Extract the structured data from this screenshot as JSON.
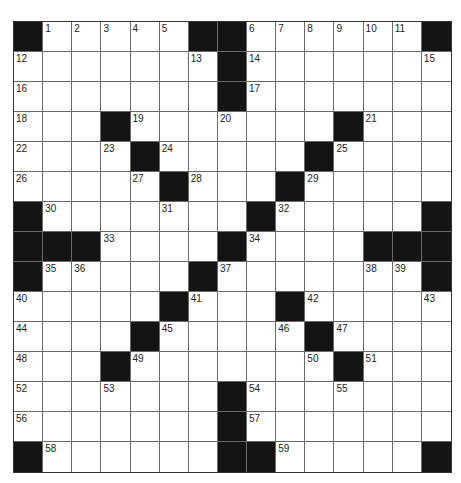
{
  "puzzle": {
    "size": 15,
    "colors": {
      "black_cell": "#141414",
      "white_cell": "#ffffff",
      "grid_line": "#6a6a6a"
    },
    "legend": "rows: '#' = black square, '.' = white square, number = numbered white square",
    "rows": [
      [
        "#",
        "1",
        "2",
        "3",
        "4",
        "5",
        "#",
        "#",
        "6",
        "7",
        "8",
        "9",
        "10",
        "11",
        "#"
      ],
      [
        "12",
        ".",
        ".",
        ".",
        ".",
        ".",
        "13",
        "#",
        "14",
        ".",
        ".",
        ".",
        ".",
        ".",
        "15"
      ],
      [
        "16",
        ".",
        ".",
        ".",
        ".",
        ".",
        ".",
        "#",
        "17",
        ".",
        ".",
        ".",
        ".",
        ".",
        "."
      ],
      [
        "18",
        ".",
        ".",
        "#",
        "19",
        ".",
        ".",
        "20",
        ".",
        ".",
        ".",
        "#",
        "21",
        ".",
        "."
      ],
      [
        "22",
        ".",
        ".",
        "23",
        "#",
        "24",
        ".",
        ".",
        ".",
        ".",
        "#",
        "25",
        ".",
        ".",
        "."
      ],
      [
        "26",
        ".",
        ".",
        ".",
        "27",
        "#",
        "28",
        ".",
        ".",
        "#",
        "29",
        ".",
        ".",
        ".",
        "."
      ],
      [
        "#",
        "30",
        ".",
        ".",
        ".",
        "31",
        ".",
        ".",
        "#",
        "32",
        ".",
        ".",
        ".",
        ".",
        "#"
      ],
      [
        "#",
        "#",
        "#",
        "33",
        ".",
        ".",
        ".",
        "#",
        "34",
        ".",
        ".",
        ".",
        "#",
        "#",
        "#"
      ],
      [
        "#",
        "35",
        "36",
        ".",
        ".",
        ".",
        "#",
        "37",
        ".",
        ".",
        ".",
        ".",
        "38",
        "39",
        "#"
      ],
      [
        "40",
        ".",
        ".",
        ".",
        ".",
        "#",
        "41",
        ".",
        ".",
        "#",
        "42",
        ".",
        ".",
        ".",
        "43"
      ],
      [
        "44",
        ".",
        ".",
        ".",
        "#",
        "45",
        ".",
        ".",
        ".",
        "46",
        "#",
        "47",
        ".",
        ".",
        "."
      ],
      [
        "48",
        ".",
        ".",
        "#",
        "49",
        ".",
        ".",
        ".",
        ".",
        ".",
        "50",
        "#",
        "51",
        ".",
        "."
      ],
      [
        "52",
        ".",
        ".",
        "53",
        ".",
        ".",
        ".",
        "#",
        "54",
        ".",
        ".",
        "55",
        ".",
        ".",
        "."
      ],
      [
        "56",
        ".",
        ".",
        ".",
        ".",
        ".",
        ".",
        "#",
        "57",
        ".",
        ".",
        ".",
        ".",
        ".",
        "."
      ],
      [
        "#",
        "58",
        ".",
        ".",
        ".",
        ".",
        ".",
        "#",
        "#",
        "59",
        ".",
        ".",
        ".",
        ".",
        "#"
      ]
    ]
  }
}
